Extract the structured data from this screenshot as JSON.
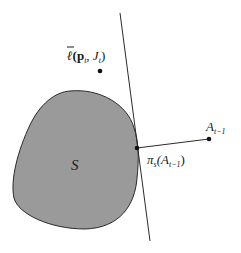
{
  "diagram": {
    "region_label": "S",
    "point_ell": {
      "label_main": "ℓ",
      "label_args": "(p",
      "label_sub_t": "t",
      "label_comma": ", J",
      "label_sub_t2": "t",
      "label_close": ")"
    },
    "point_A": {
      "label_main": "A",
      "label_sub": "t−1"
    },
    "point_proj": {
      "label_main": "π",
      "label_sub": "s",
      "label_open": "(A",
      "label_sub2": "t−1",
      "label_close": ")"
    },
    "colors": {
      "region_fill": "#9a9a9a",
      "stroke": "#2a2a2a",
      "background": "#ffffff"
    }
  }
}
